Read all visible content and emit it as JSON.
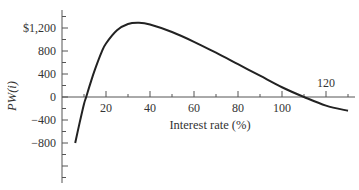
{
  "chart_data": {
    "type": "line",
    "title": "",
    "xlabel": "Interest rate (%)",
    "ylabel": "PW(i)",
    "x_ticks": [
      20,
      40,
      60,
      80,
      100,
      120
    ],
    "y_ticks": [
      -800,
      -400,
      0,
      400,
      800,
      1200
    ],
    "y_tick_labels": [
      "−800",
      "−400",
      "0",
      "400",
      "800",
      "$1,200"
    ],
    "xlim": [
      0,
      130
    ],
    "ylim": [
      -1500,
      1500
    ],
    "grid": false,
    "legend": null,
    "series": [
      {
        "name": "PW(i)",
        "x": [
          6,
          8,
          10,
          11,
          13,
          15,
          18,
          20,
          25,
          30,
          35,
          40,
          50,
          60,
          70,
          80,
          90,
          100,
          110,
          120,
          130
        ],
        "y": [
          -800,
          -450,
          -120,
          0,
          250,
          480,
          780,
          930,
          1160,
          1270,
          1290,
          1260,
          1130,
          960,
          770,
          570,
          370,
          170,
          0,
          -150,
          -240
        ]
      }
    ],
    "annotations": [
      "Curve crosses zero near i ≈ 11% and i ≈ 110%",
      "Maximum ≈ $1,290 near i ≈ 35%"
    ]
  }
}
